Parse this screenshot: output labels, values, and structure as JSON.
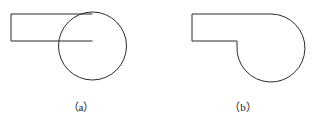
{
  "figure": {
    "background_color": "#ffffff",
    "stroke_color": "#2b2b2b",
    "stroke_width": 1,
    "caption_a": "（a）",
    "caption_b": "（b）",
    "panels": [
      {
        "id": "panel-a",
        "label": "（a）",
        "description": "Rectangle overlapping a full circle with construction lines visible",
        "circle": {
          "cx": 92.5,
          "cy": 46,
          "r": 34
        },
        "rectangle": {
          "x": 11,
          "y": 14,
          "width": 81.5,
          "height": 27
        },
        "rect_top_line": {
          "x1": 11,
          "y1": 14,
          "x2": 92.5,
          "y2": 14
        },
        "rect_bottom_line": {
          "x1": 11,
          "y1": 41,
          "x2": 92.5,
          "y2": 41
        },
        "rect_left_line": {
          "x1": 11,
          "y1": 14,
          "x2": 11,
          "y2": 41
        }
      },
      {
        "id": "panel-b",
        "label": "（b）",
        "description": "Merged silhouette of rectangle and circle with hidden lines removed",
        "circle": {
          "cx": 271,
          "cy": 46,
          "r": 34
        },
        "top_line": {
          "x1": 192,
          "y1": 14,
          "x2": 271,
          "y2": 14
        },
        "left_line": {
          "x1": 192,
          "y1": 14,
          "x2": 192,
          "y2": 41
        },
        "bottom_line": {
          "x1": 192,
          "y1": 41,
          "x2": 237,
          "y2": 41
        },
        "notch_line": {
          "x1": 237,
          "y1": 41,
          "x2": 237,
          "y2": 46
        }
      }
    ]
  }
}
